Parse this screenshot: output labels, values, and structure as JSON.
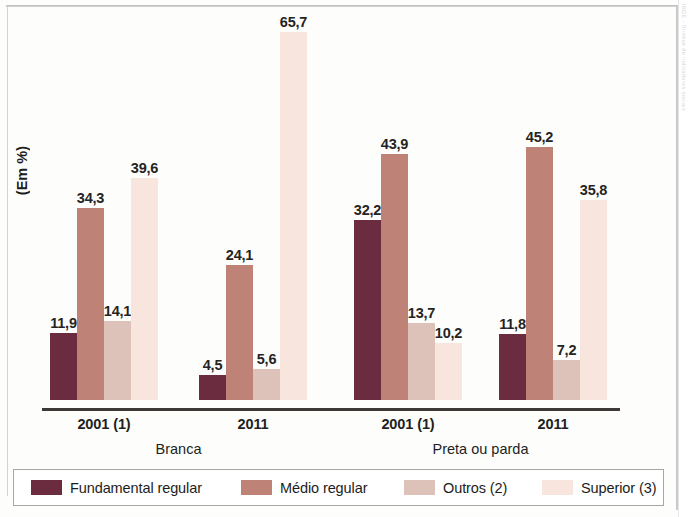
{
  "chart_data": {
    "type": "bar",
    "title": "",
    "subtitle": "",
    "xlabel": "",
    "ylabel": "(Em %)",
    "ylim": [
      0,
      70
    ],
    "grid": false,
    "legend_position": "bottom",
    "decimal_separator": ",",
    "categories": [
      "2001 (1)",
      "2011",
      "2001 (1)",
      "2011"
    ],
    "group_labels": [
      "Branca",
      "Preta ou parda"
    ],
    "groups": [
      {
        "supercategory": "Branca",
        "category": "2001 (1)",
        "values": [
          11.9,
          34.3,
          14.1,
          39.6
        ],
        "labels": [
          "11,9",
          "34,3",
          "14,1",
          "39,6"
        ]
      },
      {
        "supercategory": "Branca",
        "category": "2011",
        "values": [
          4.5,
          24.1,
          5.6,
          65.7
        ],
        "labels": [
          "4,5",
          "24,1",
          "5,6",
          "65,7"
        ]
      },
      {
        "supercategory": "Preta ou parda",
        "category": "2001 (1)",
        "values": [
          32.2,
          43.9,
          13.7,
          10.2
        ],
        "labels": [
          "32,2",
          "43,9",
          "13,7",
          "10,2"
        ]
      },
      {
        "supercategory": "Preta ou parda",
        "category": "2011",
        "values": [
          11.8,
          45.2,
          7.2,
          35.8
        ],
        "labels": [
          "11,8",
          "45,2",
          "7,2",
          "35,8"
        ]
      }
    ],
    "series": [
      {
        "name": "Fundamental regular",
        "color": "#6b2c40",
        "values": [
          11.9,
          4.5,
          32.2,
          11.8
        ],
        "labels": [
          "11,9",
          "4,5",
          "32,2",
          "11,8"
        ]
      },
      {
        "name": "Médio regular",
        "color": "#bf8276",
        "values": [
          34.3,
          24.1,
          43.9,
          45.2
        ],
        "labels": [
          "34,3",
          "24,1",
          "43,9",
          "45,2"
        ]
      },
      {
        "name": "Outros (2)",
        "color": "#ddc2b9",
        "values": [
          14.1,
          5.6,
          13.7,
          7.2
        ],
        "labels": [
          "14,1",
          "5,6",
          "13,7",
          "7,2"
        ]
      },
      {
        "name": "Superior (3)",
        "color": "#f8e6de",
        "values": [
          39.6,
          65.7,
          10.2,
          35.8
        ],
        "labels": [
          "39,6",
          "65,7",
          "10,2",
          "35,8"
        ]
      }
    ]
  },
  "legend": {
    "items": [
      {
        "label": "Fundamental regular",
        "color": "#6b2c40"
      },
      {
        "label": "Médio regular",
        "color": "#bf8276"
      },
      {
        "label": "Outros (2)",
        "color": "#ddc2b9"
      },
      {
        "label": "Superior (3)",
        "color": "#f8e6de"
      }
    ]
  },
  "axis": {
    "y_title": "(Em %)"
  },
  "scan": {
    "edge_artifact_text": "IBGE - Síntese de indicadores sociais"
  }
}
